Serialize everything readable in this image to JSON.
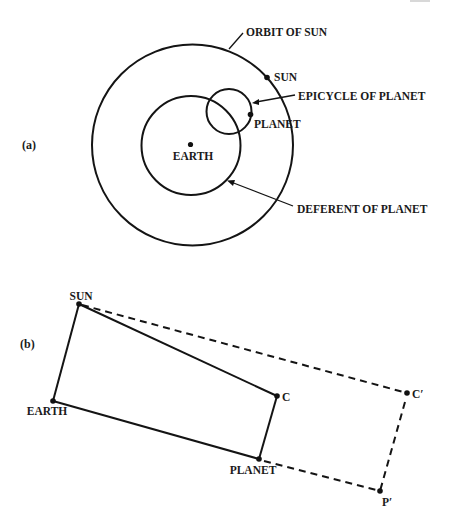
{
  "figure": {
    "panel_a": {
      "panel_label": "(a)",
      "labels": {
        "orbit_of_sun": "ORBIT OF SUN",
        "sun": "SUN",
        "epicycle_of_planet": "EPICYCLE OF PLANET",
        "planet": "PLANET",
        "earth": "EARTH",
        "deferent_of_planet": "DEFERENT OF PLANET"
      }
    },
    "panel_b": {
      "panel_label": "(b)",
      "labels": {
        "sun": "SUN",
        "earth": "EARTH",
        "c": "C",
        "planet": "PLANET",
        "c_prime": "C′",
        "p_prime": "P′"
      }
    },
    "colors": {
      "ink": "#141414",
      "background": "#ffffff"
    }
  }
}
